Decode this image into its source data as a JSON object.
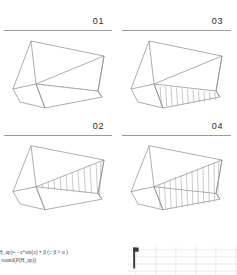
{
  "figure": {
    "type": "technical-line-drawing-grid",
    "panel_count": 4,
    "stroke_color": "#8a8a8a",
    "label_color": "#2b2b2b",
    "background": "#ffffff"
  },
  "panels": [
    {
      "label": "01",
      "position": "top-left",
      "description": "wedge solid, diagonal ridge line, no hatching",
      "hatch_count": 0,
      "hatch_region": "none"
    },
    {
      "label": "03",
      "position": "top-right",
      "description": "wedge solid with vertical hatching on lower inclined face",
      "hatch_count": 11,
      "hatch_region": "lower-inclined-face"
    },
    {
      "label": "02",
      "position": "bottom-left",
      "description": "wedge solid with vertical hatching on upper inclined face",
      "hatch_count": 11,
      "hatch_region": "upper-inclined-face"
    },
    {
      "label": "04",
      "position": "bottom-right",
      "description": "wedge solid with dense vertical hatching filling full inclined face",
      "hatch_count": 12,
      "hatch_region": "full-inclined-face"
    }
  ],
  "formula": {
    "line1": "(H_up)= - a*sin(a) + β  (∵  β > α   )",
    "line2": "= round(P(H_up))"
  },
  "mini_plot": {
    "type": "grid",
    "description": "faint cropped grid plot with dark vertical axis marker at left",
    "axis_marker_color": "#3a3a3a",
    "grid_color": "#d8dfe4"
  }
}
